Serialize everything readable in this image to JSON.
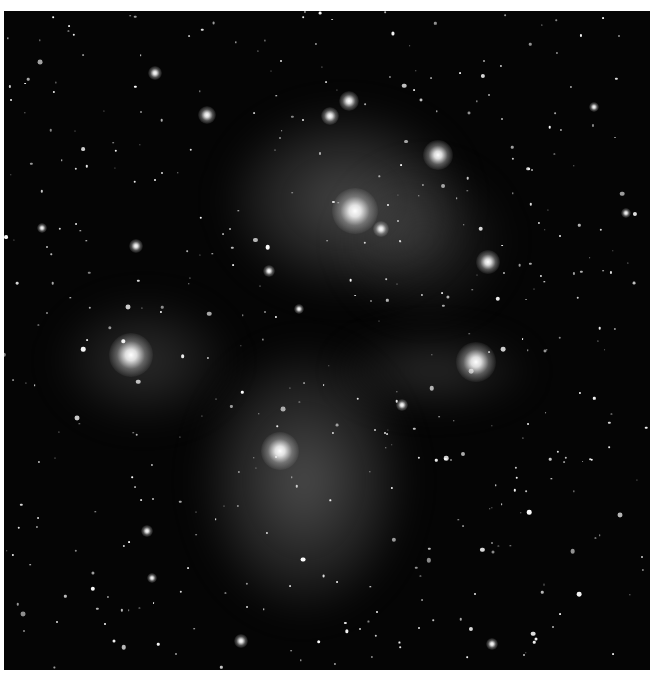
{
  "image": {
    "subject": "Pleiades star cluster with reflection nebula",
    "mode": "grayscale",
    "background": "#050505",
    "frame_background": "#ffffff"
  },
  "nebulae": [
    {
      "x": 340,
      "y": 190,
      "w": 230,
      "h": 180,
      "o": 0.35
    },
    {
      "x": 300,
      "y": 470,
      "w": 200,
      "h": 260,
      "o": 0.38
    },
    {
      "x": 140,
      "y": 350,
      "w": 170,
      "h": 120,
      "o": 0.22
    },
    {
      "x": 430,
      "y": 360,
      "w": 190,
      "h": 70,
      "o": 0.22
    },
    {
      "x": 420,
      "y": 230,
      "w": 160,
      "h": 150,
      "o": 0.18
    }
  ],
  "bright_stars": [
    {
      "x": 351,
      "y": 200,
      "r": 46
    },
    {
      "x": 127,
      "y": 344,
      "r": 44
    },
    {
      "x": 472,
      "y": 351,
      "r": 40
    },
    {
      "x": 276,
      "y": 440,
      "r": 38
    },
    {
      "x": 434,
      "y": 144,
      "r": 30
    },
    {
      "x": 484,
      "y": 251,
      "r": 24
    },
    {
      "x": 345,
      "y": 90,
      "r": 20
    },
    {
      "x": 326,
      "y": 105,
      "r": 18
    },
    {
      "x": 203,
      "y": 104,
      "r": 18
    },
    {
      "x": 377,
      "y": 218,
      "r": 16
    },
    {
      "x": 151,
      "y": 62,
      "r": 14
    },
    {
      "x": 132,
      "y": 235,
      "r": 14
    },
    {
      "x": 265,
      "y": 260,
      "r": 12
    },
    {
      "x": 398,
      "y": 394,
      "r": 12
    },
    {
      "x": 237,
      "y": 630,
      "r": 14
    },
    {
      "x": 143,
      "y": 520,
      "r": 12
    },
    {
      "x": 148,
      "y": 567,
      "r": 10
    },
    {
      "x": 295,
      "y": 298,
      "r": 10
    },
    {
      "x": 38,
      "y": 217,
      "r": 10
    },
    {
      "x": 590,
      "y": 96,
      "r": 10
    },
    {
      "x": 622,
      "y": 202,
      "r": 10
    },
    {
      "x": 488,
      "y": 633,
      "r": 12
    }
  ]
}
